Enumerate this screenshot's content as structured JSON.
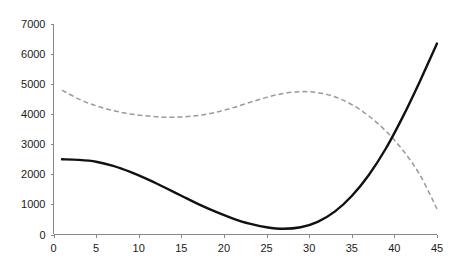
{
  "chart_data": {
    "type": "line",
    "title": "",
    "subtitle": "",
    "xlabel": "",
    "ylabel": "",
    "xlim": [
      0,
      45
    ],
    "ylim": [
      0,
      7000
    ],
    "grid": false,
    "legend": null,
    "legend_position": "none",
    "x_ticks": [
      0,
      5,
      10,
      15,
      20,
      25,
      30,
      35,
      40,
      45
    ],
    "y_ticks": [
      0,
      1000,
      2000,
      3000,
      4000,
      5000,
      6000,
      7000
    ],
    "x_tick_labels": [
      "0",
      "5",
      "10",
      "15",
      "20",
      "25",
      "30",
      "35",
      "40",
      "45"
    ],
    "y_tick_labels": [
      "0",
      "1000",
      "2000",
      "3000",
      "4000",
      "5000",
      "6000",
      "7000"
    ],
    "x": [
      1,
      3,
      5,
      7,
      9,
      11,
      13,
      15,
      17,
      19,
      21,
      23,
      25,
      27,
      29,
      31,
      33,
      35,
      37,
      39,
      41,
      43,
      45
    ],
    "series": [
      {
        "name": "series-1",
        "style": "solid",
        "color": "#111111",
        "values": [
          2500,
          2480,
          2420,
          2280,
          2080,
          1840,
          1570,
          1290,
          1010,
          760,
          540,
          360,
          240,
          190,
          240,
          420,
          760,
          1280,
          1980,
          2860,
          3920,
          5100,
          6350
        ]
      },
      {
        "name": "series-2",
        "style": "dashed",
        "color": "#9a9a9a",
        "values": [
          4800,
          4500,
          4280,
          4120,
          4010,
          3940,
          3900,
          3910,
          3960,
          4060,
          4210,
          4390,
          4560,
          4690,
          4750,
          4720,
          4580,
          4320,
          3940,
          3440,
          2800,
          1980,
          850
        ]
      }
    ],
    "annotations": []
  },
  "colors": {
    "background": "#ffffff",
    "axis": "#888888",
    "text": "#1a1a1a",
    "series_solid": "#111111",
    "series_dashed": "#9a9a9a"
  }
}
